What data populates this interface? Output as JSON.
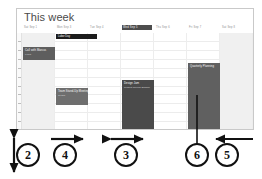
{
  "panel": {
    "title": "This week"
  },
  "calendar": {
    "day_headers": [
      {
        "label": "Sat Sep 1",
        "selected": false,
        "shaded": true
      },
      {
        "label": "Mon Sep 3",
        "selected": false,
        "shaded": false
      },
      {
        "label": "Tue Sep 4",
        "selected": false,
        "shaded": false
      },
      {
        "label": "Wed Sep 5",
        "selected": true,
        "shaded": false
      },
      {
        "label": "Thu Sep 6",
        "selected": false,
        "shaded": false
      },
      {
        "label": "Fri Sep 7",
        "selected": false,
        "shaded": false
      },
      {
        "label": "Sat Sep 8",
        "selected": false,
        "shaded": true
      }
    ],
    "allday_events": [
      {
        "label": "Labor Day",
        "column": 1
      }
    ],
    "events": [
      {
        "title": "Call with Marcus",
        "subtitle": "9:00a",
        "column": 0,
        "color": "#5e5e5e"
      },
      {
        "title": "Team Stand-Up Meeting",
        "subtitle": "11:30a",
        "column": 1,
        "color": "#6e6e6e"
      },
      {
        "title": "Design Jam",
        "subtitle": "Product Review Session",
        "column": 3,
        "color": "#4a4a4a"
      },
      {
        "title": "Quarterly Planning",
        "subtitle": "",
        "column": 5,
        "color": "#606060"
      }
    ],
    "time_tick_count": 11,
    "hour_line_count": 11
  },
  "annotations": {
    "callouts": [
      {
        "number": "2",
        "kind": "vertical-double-arrow"
      },
      {
        "number": "4",
        "kind": "right-arrow"
      },
      {
        "number": "3",
        "kind": "horizontal-double-arrow"
      },
      {
        "number": "6",
        "kind": "leader-line"
      },
      {
        "number": "5",
        "kind": "left-arrow"
      }
    ]
  },
  "colors": {
    "panel_border": "#c9c9c9",
    "title_text": "#4a4a4a",
    "shaded_column": "#f0f0f0",
    "allday_bar": "#1c1c1c",
    "annotation_ink": "#111111"
  }
}
